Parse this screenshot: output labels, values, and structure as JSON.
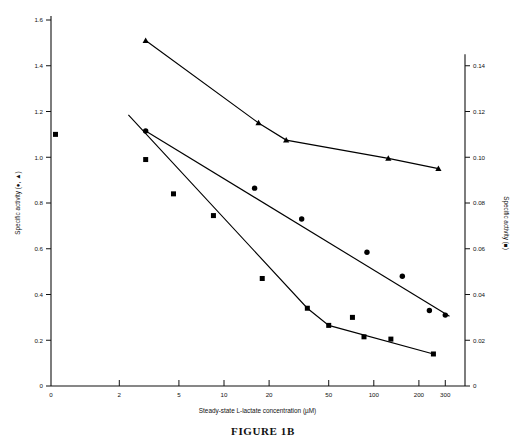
{
  "figure": {
    "caption": "FIGURE 1B"
  },
  "chart_data": {
    "type": "scatter",
    "title": "",
    "xlabel": "Steady-state L-lactate concentration (µM)",
    "ylabel_left": "Specific activity (●, ▲)",
    "ylabel_right": "Specific activity (■)",
    "xscale": "log",
    "xlim": [
      0.7,
      400
    ],
    "xticks": [
      2,
      5,
      10,
      20,
      50,
      100,
      200,
      300
    ],
    "xticklabels": [
      "2",
      "5",
      "10",
      "20",
      "50",
      "100",
      "200",
      "300"
    ],
    "xorigin_label": "0",
    "ylim_left": [
      0,
      1.6
    ],
    "yticks_left": [
      0,
      0.2,
      0.4,
      0.6,
      0.8,
      1.0,
      1.2,
      1.4,
      1.6
    ],
    "yticklabels_left": [
      "0",
      "0.2",
      "0.4",
      "0.6",
      "0.8",
      "1.0",
      "1.2",
      "1.4",
      "1.6"
    ],
    "ylim_right": [
      0,
      0.16
    ],
    "yticks_right": [
      0,
      0.02,
      0.04,
      0.06,
      0.08,
      0.1,
      0.12,
      0.14
    ],
    "yticklabels_right": [
      "0",
      "0.02",
      "0.04",
      "0.06",
      "0.08",
      "0.10",
      "0.12",
      "0.14"
    ],
    "grid": false,
    "legend_position": "none",
    "series": [
      {
        "name": "triangle-series",
        "marker": "triangle",
        "axis": "left",
        "color": "#000000",
        "points": [
          {
            "x": 3.0,
            "y": 1.51
          },
          {
            "x": 17.0,
            "y": 1.15
          },
          {
            "x": 26.0,
            "y": 1.075
          },
          {
            "x": 125.0,
            "y": 0.995
          },
          {
            "x": 270.0,
            "y": 0.95
          }
        ],
        "line": [
          {
            "x": 3.0,
            "y": 1.51
          },
          {
            "x": 17.0,
            "y": 1.15
          },
          {
            "x": 26.0,
            "y": 1.075
          },
          {
            "x": 125.0,
            "y": 0.995
          },
          {
            "x": 270.0,
            "y": 0.95
          }
        ]
      },
      {
        "name": "circle-series",
        "marker": "circle",
        "axis": "left",
        "color": "#000000",
        "points": [
          {
            "x": 3.0,
            "y": 1.115
          },
          {
            "x": 16.0,
            "y": 0.865
          },
          {
            "x": 33.0,
            "y": 0.73
          },
          {
            "x": 90.0,
            "y": 0.585
          },
          {
            "x": 155.0,
            "y": 0.48
          },
          {
            "x": 235.0,
            "y": 0.33
          },
          {
            "x": 300.0,
            "y": 0.31
          }
        ],
        "line": [
          {
            "x": 3.0,
            "y": 1.115
          },
          {
            "x": 320.0,
            "y": 0.305
          }
        ]
      },
      {
        "name": "square-series",
        "marker": "square",
        "axis": "right",
        "color": "#000000",
        "points": [
          {
            "x": 0.75,
            "y": 0.11
          },
          {
            "x": 3.0,
            "y": 0.099
          },
          {
            "x": 4.6,
            "y": 0.084
          },
          {
            "x": 8.5,
            "y": 0.0745
          },
          {
            "x": 18.0,
            "y": 0.047
          },
          {
            "x": 36.0,
            "y": 0.034
          },
          {
            "x": 50.0,
            "y": 0.0265
          },
          {
            "x": 72.0,
            "y": 0.03
          },
          {
            "x": 86.0,
            "y": 0.0215
          },
          {
            "x": 130.0,
            "y": 0.0205
          },
          {
            "x": 250.0,
            "y": 0.014
          }
        ],
        "line": [
          {
            "x": 2.3,
            "y": 0.1185
          },
          {
            "x": 36.0,
            "y": 0.034
          },
          {
            "x": 50.0,
            "y": 0.0265
          },
          {
            "x": 250.0,
            "y": 0.014
          }
        ]
      }
    ]
  }
}
